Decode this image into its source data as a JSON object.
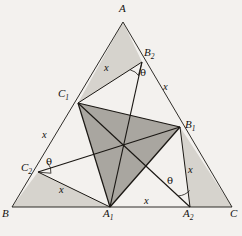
{
  "figure": {
    "background_color": "#f3f1ee",
    "line_color": "#1a1713",
    "outer_fill": "#d6d3cd",
    "inner_fill": "#a9a6a0",
    "vertices": {
      "A": {
        "x": 123,
        "y": 22,
        "label": "A"
      },
      "B": {
        "x": 12,
        "y": 207,
        "label": "B"
      },
      "C": {
        "x": 232,
        "y": 207,
        "label": "C"
      },
      "A1": {
        "x": 110,
        "y": 207,
        "label": "A1"
      },
      "A2": {
        "x": 190,
        "y": 207,
        "label": "A2"
      },
      "B1": {
        "x": 180,
        "y": 127,
        "label": "B1"
      },
      "B2": {
        "x": 142,
        "y": 62,
        "label": "B2"
      },
      "C1": {
        "x": 78,
        "y": 103,
        "label": "C1"
      },
      "C2": {
        "x": 38,
        "y": 172,
        "label": "C2"
      },
      "P": {
        "x": 123,
        "y": 148,
        "label": "center"
      }
    },
    "vertex_labels": [
      {
        "name": "vertex-label-A",
        "base": "A",
        "sub": "",
        "x": 119,
        "y": 4
      },
      {
        "name": "vertex-label-B",
        "base": "B",
        "sub": "",
        "x": 2,
        "y": 209
      },
      {
        "name": "vertex-label-C",
        "base": "C",
        "sub": "",
        "x": 231,
        "y": 209
      },
      {
        "name": "vertex-label-A1",
        "base": "A",
        "sub": "1",
        "x": 104,
        "y": 209
      },
      {
        "name": "vertex-label-A2",
        "base": "A",
        "sub": "2",
        "x": 184,
        "y": 209
      },
      {
        "name": "vertex-label-B1",
        "base": "B",
        "sub": "1",
        "x": 185,
        "y": 120
      },
      {
        "name": "vertex-label-B2",
        "base": "B",
        "sub": "2",
        "x": 145,
        "y": 48
      },
      {
        "name": "vertex-label-C1",
        "base": "C",
        "sub": "1",
        "x": 59,
        "y": 89
      },
      {
        "name": "vertex-label-C2",
        "base": "C",
        "sub": "2",
        "x": 22,
        "y": 163
      }
    ],
    "length_labels": [
      {
        "name": "length-label-x-c1b2",
        "text": "x",
        "x": 104,
        "y": 63
      },
      {
        "name": "length-label-x-b2b1",
        "text": "x",
        "x": 163,
        "y": 82
      },
      {
        "name": "length-label-x-bc1",
        "text": "x",
        "x": 42,
        "y": 130
      },
      {
        "name": "length-label-x-c2a1",
        "text": "x",
        "x": 59,
        "y": 185
      },
      {
        "name": "length-label-x-a1a2",
        "text": "x",
        "x": 146,
        "y": 198
      },
      {
        "name": "length-label-x-b1a2",
        "text": "x",
        "x": 189,
        "y": 165
      }
    ],
    "angle_labels": [
      {
        "name": "angle-label-theta-b2",
        "text": "θ",
        "x": 141,
        "y": 70
      },
      {
        "name": "angle-label-theta-c2",
        "text": "θ",
        "x": 47,
        "y": 159
      },
      {
        "name": "angle-label-theta-a2",
        "text": "θ",
        "x": 168,
        "y": 178
      }
    ],
    "shaded_outer_regions": [
      {
        "name": "region-A-C1-B2",
        "points": "123,22 78,103 142,62"
      },
      {
        "name": "region-B-C2-A1",
        "points": "12,207 38,172 110,207"
      },
      {
        "name": "region-C-A2-B1",
        "points": "232,207 190,207 180,127"
      }
    ],
    "shaded_inner_region": {
      "name": "region-inner-triangle",
      "points": "78,103 180,127 110,207"
    },
    "cevian_lines": [
      {
        "name": "line-C1-A2",
        "from": "C1",
        "to": "A2"
      },
      {
        "name": "line-C2-B1",
        "from": "C2",
        "to": "B1"
      },
      {
        "name": "line-B2-A1",
        "from": "B2",
        "to": "A1"
      }
    ],
    "outline_lines": [
      {
        "name": "line-A-B",
        "from": "A",
        "to": "B"
      },
      {
        "name": "line-A-C",
        "from": "A",
        "to": "C"
      },
      {
        "name": "line-B-C",
        "from": "B",
        "to": "C"
      }
    ],
    "inner_triangle_lines": [
      {
        "name": "line-C1-B1",
        "from": "C1",
        "to": "B1"
      },
      {
        "name": "line-B1-A1",
        "from": "B1",
        "to": "A1"
      },
      {
        "name": "line-A1-C1",
        "from": "A1",
        "to": "C1"
      }
    ],
    "chord_lines": [
      {
        "name": "line-C1-B2",
        "from": "C1",
        "to": "B2"
      },
      {
        "name": "line-C2-A1",
        "from": "C2",
        "to": "A1"
      },
      {
        "name": "line-B1-A2",
        "from": "B1",
        "to": "A2"
      }
    ]
  }
}
